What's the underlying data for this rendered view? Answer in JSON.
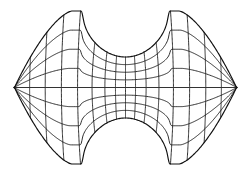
{
  "figure": {
    "name": "curvilinear-grid-diagram",
    "type": "mesh",
    "background_color": "#ffffff",
    "line_color": "#1a1a1a",
    "boundary_color": "#111111",
    "axis_color": "#333333",
    "canvas": {
      "width": 251,
      "height": 175
    }
  },
  "geometry": {
    "center": {
      "x": 125.5,
      "y": 87.5
    },
    "half_width": 111.5,
    "half_height": 77.5,
    "left_extreme_x": 14,
    "right_extreme_x": 237,
    "top_extreme_y": 10,
    "bottom_extreme_y": 165,
    "notch": {
      "shape": "circular-concave",
      "top_center": {
        "x": 125.5,
        "y": 11.0
      },
      "bottom_center": {
        "x": 125.5,
        "y": 164.0
      },
      "radius": 46.0,
      "depth": 34.0,
      "half_span": 57.0
    },
    "lobe": {
      "shape": "convex-arc",
      "peak_top": {
        "x": 70,
        "y": 12
      },
      "peak_bottom": {
        "x": 70,
        "y": 163
      },
      "bulge": 10.5
    }
  },
  "mesh_data": {
    "type": "structured-curvilinear",
    "family_u_count": 15,
    "family_v_count": 9,
    "u_label": "quasi-radial lines (vertical family)",
    "v_label": "quasi-circumferential lines (horizontal family)",
    "cells_across": 14,
    "cells_down": 8,
    "u_positions": [
      -1.0,
      -0.86,
      -0.72,
      -0.575,
      -0.43,
      -0.3,
      -0.185,
      -0.09,
      0.0,
      0.09,
      0.185,
      0.3,
      0.43,
      0.575,
      0.72,
      0.86,
      1.0
    ],
    "v_positions": [
      -1.0,
      -0.75,
      -0.5,
      -0.25,
      0.0,
      0.25,
      0.5,
      0.75,
      1.0
    ],
    "center_axis": {
      "visible": true,
      "orientation": "horizontal",
      "y": 87.5,
      "x_start": 14,
      "x_end": 237
    },
    "waist_compression": 0.62,
    "notes": "Grid is densest near the central waist between the two concave notches and relaxes outward toward the left and right lobes."
  }
}
